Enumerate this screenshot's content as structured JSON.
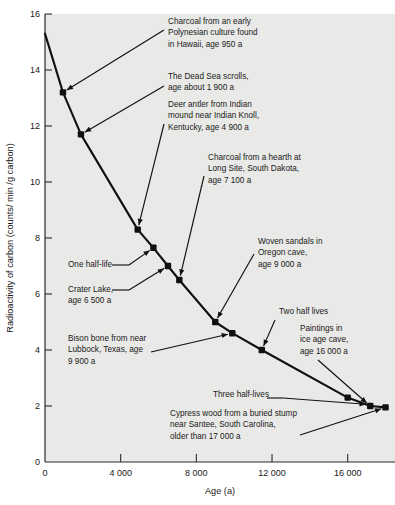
{
  "chart_data": {
    "type": "line",
    "title": "",
    "xlabel": "Age (a)",
    "ylabel": "Radioactivity of carbon (counts/ min /g carbon)",
    "xlim": [
      0,
      18500
    ],
    "ylim": [
      0,
      16
    ],
    "xticks": [
      0,
      4000,
      8000,
      12000,
      16000
    ],
    "xticklabels": [
      "0",
      "4 000",
      "8 000",
      "12 000",
      "16 000"
    ],
    "yticks": [
      2,
      4,
      6,
      8,
      10,
      12,
      14,
      16
    ],
    "yticklabels": [
      "2",
      "4",
      "6",
      "8",
      "10",
      "12",
      "14",
      "16"
    ],
    "grid": false,
    "legend": "none",
    "series": [
      {
        "name": "Radiocarbon decay curve",
        "x": [
          0,
          950,
          1900,
          4900,
          5730,
          6500,
          7100,
          9000,
          9900,
          11460,
          16000,
          17190,
          18000
        ],
        "y": [
          15.3,
          13.2,
          11.7,
          8.3,
          7.65,
          7.0,
          6.5,
          5.0,
          4.6,
          4.0,
          2.3,
          2.0,
          1.95
        ]
      }
    ],
    "markers": [
      {
        "label": "charcoal-polynesian",
        "x": 950,
        "y": 13.2
      },
      {
        "label": "dead-sea-scrolls",
        "x": 1900,
        "y": 11.7
      },
      {
        "label": "deer-antler",
        "x": 4900,
        "y": 8.3
      },
      {
        "label": "one-half-life",
        "x": 5730,
        "y": 7.65
      },
      {
        "label": "crater-lake",
        "x": 6500,
        "y": 7.0
      },
      {
        "label": "charcoal-hearth",
        "x": 7100,
        "y": 6.5
      },
      {
        "label": "woven-sandals",
        "x": 9000,
        "y": 5.0
      },
      {
        "label": "bison-bone",
        "x": 9900,
        "y": 4.6
      },
      {
        "label": "two-half-lives",
        "x": 11460,
        "y": 4.0
      },
      {
        "label": "ice-age-paintings",
        "x": 16000,
        "y": 2.3
      },
      {
        "label": "three-half-lives",
        "x": 17190,
        "y": 2.0
      },
      {
        "label": "cypress-wood",
        "x": 18000,
        "y": 1.95
      }
    ],
    "annotations": [
      {
        "name": "charcoal-polynesian",
        "lines": [
          "Charcoal from an early",
          "Polynesian culture found",
          "in Hawaii, age 950 a"
        ]
      },
      {
        "name": "dead-sea-scrolls",
        "lines": [
          "The Dead Sea scrolls,",
          "age about 1 900 a"
        ]
      },
      {
        "name": "deer-antler",
        "lines": [
          "Deer antler from Indian",
          "mound near Indian Knoll,",
          "Kentucky, age 4 900 a"
        ]
      },
      {
        "name": "charcoal-hearth",
        "lines": [
          "Charcoal from a hearth at",
          "Long Site, South Dakota,",
          "age 7 100 a"
        ]
      },
      {
        "name": "woven-sandals",
        "lines": [
          "Woven sandals in",
          "Oregon cave,",
          "age 9 000 a"
        ]
      },
      {
        "name": "one-half-life",
        "lines": [
          "One half-life"
        ]
      },
      {
        "name": "crater-lake",
        "lines": [
          "Crater Lake,",
          "age 6 500 a"
        ]
      },
      {
        "name": "two-half-lives",
        "lines": [
          "Two half lives"
        ]
      },
      {
        "name": "bison-bone",
        "lines": [
          "Bison bone from near",
          "Lubbock, Texas, age",
          "9 900 a"
        ]
      },
      {
        "name": "ice-age-paintings",
        "lines": [
          "Paintings in",
          "ice age cave,",
          "age 16 000 a"
        ]
      },
      {
        "name": "three-half-lives",
        "lines": [
          "Three half-lives"
        ]
      },
      {
        "name": "cypress-wood",
        "lines": [
          "Cypress wood from a buried stump",
          "near Santee, South Carolina,",
          "older than 17 000 a"
        ]
      }
    ],
    "colors": {
      "plot_background": "#e9e9e7",
      "page_background": "#ffffff",
      "curve": "#101010",
      "marker": "#101010",
      "axis": "#2b2b2b",
      "text": "#191919"
    }
  }
}
